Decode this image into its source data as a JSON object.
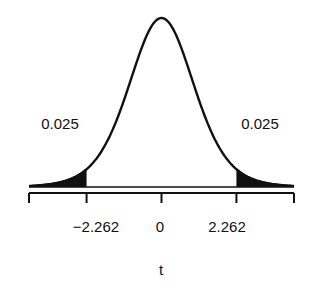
{
  "chart_data": {
    "type": "area",
    "title": "",
    "xlabel": "t",
    "ylabel": "",
    "distribution": "Student t, df = 9",
    "xlim": [
      -4,
      4
    ],
    "x_ticks": [
      -4,
      -2.262,
      0,
      2.262,
      4
    ],
    "x_tick_labels": [
      "",
      "−2.262",
      "0",
      "2.262",
      ""
    ],
    "critical_values": [
      -2.262,
      2.262
    ],
    "shaded_regions": [
      {
        "from": -4,
        "to": -2.262,
        "area": 0.025
      },
      {
        "from": 2.262,
        "to": 4,
        "area": 0.025
      }
    ],
    "annotations": [
      {
        "text": "0.025",
        "position": "left tail"
      },
      {
        "text": "0.025",
        "position": "right tail"
      }
    ],
    "grid": false,
    "legend": null
  },
  "labels": {
    "left_area": "0.025",
    "right_area": "0.025",
    "tick_left": "−2.262",
    "tick_center": "0",
    "tick_right": "2.262",
    "x_axis_label": "t"
  },
  "colors": {
    "curve": "#111111",
    "shade": "#111111",
    "background": "#ffffff"
  }
}
